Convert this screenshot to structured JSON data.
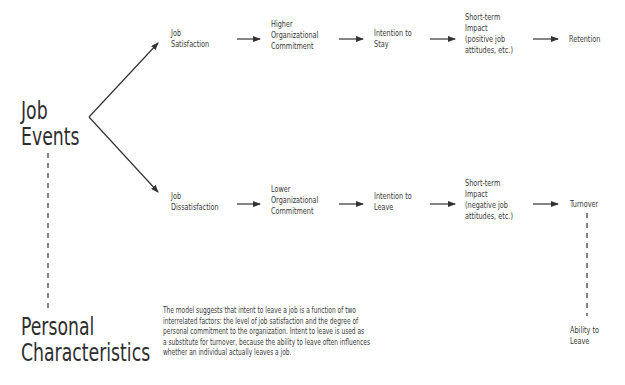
{
  "left_labels": {
    "job_events": [
      "Job",
      "Events"
    ],
    "personal_characteristics": [
      "Personal",
      "Characteristics"
    ]
  },
  "top_path": {
    "nodes": [
      [
        "Job",
        "Satisfaction"
      ],
      [
        "Higher",
        "Organizational",
        "Commitment"
      ],
      [
        "Intention to",
        "Stay"
      ],
      [
        "Short-term",
        "Impact",
        "(positive job",
        "attitudes, etc.)"
      ],
      [
        "Retention"
      ]
    ]
  },
  "bottom_path": {
    "nodes": [
      [
        "Job",
        "Dissatisfaction"
      ],
      [
        "Lower",
        "Organizational",
        "Commitment"
      ],
      [
        "Intention to",
        "Leave"
      ],
      [
        "Short-term",
        "Impact",
        "(negative job",
        "attitudes, etc.)"
      ],
      [
        "Turnover"
      ]
    ]
  },
  "ability_to_leave": [
    "Ability to",
    "Leave"
  ],
  "note": [
    "The model suggests that intent to leave a job is a function of two",
    "interrelated factors: the level of job satisfaction and the degree of",
    "personal commitment to the organization. Intent to leave is used as",
    "a substitute for turnover, because the ability to leave often influences",
    "whether an individual actually leaves a job."
  ],
  "colors": {
    "text": "#3a3a3a",
    "line": "#333333",
    "background": "#ffffff"
  }
}
